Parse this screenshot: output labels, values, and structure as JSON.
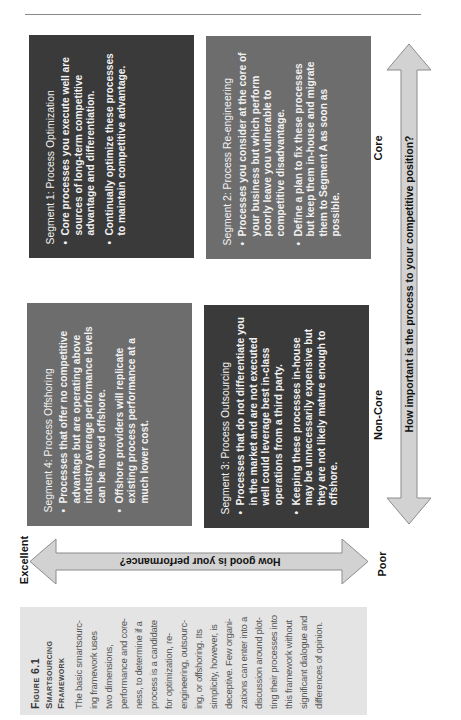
{
  "figure": {
    "number_label": "Figure 6.1",
    "title_lines": [
      "Smartsourcing",
      "Framework"
    ],
    "caption_lines": [
      "The basic smartsourc-",
      "ing framework uses",
      "two dimensions,",
      "performance and core-",
      "ness, to determine if a",
      "process is a candidate",
      "for optimization, re-",
      "engineering, outsourc-",
      "ing, or offshoring. Its",
      "simplicity, however, is",
      "deceptive. Few organi-",
      "zations can enter into a",
      "discussion around plot-",
      "ting their processes into",
      "this framework without",
      "significant dialogue and",
      "differences of opinion."
    ]
  },
  "axes": {
    "importance": {
      "question": "How important is the process to your competitive position?",
      "high_label": "Core",
      "low_label": "Non-Core"
    },
    "performance": {
      "question": "How good is your performance?",
      "high_label": "Excellent",
      "low_label": "Poor"
    }
  },
  "segments": {
    "seg1": {
      "title": "Segment 1: Process Optimization",
      "bullets": [
        "Core processes you execute well are sources of long-term competitive advantage and differentiation.",
        "Continually optimize these processes to maintain competitive advantage."
      ]
    },
    "seg2": {
      "title": "Segment 2: Process Re-engineering",
      "bullets": [
        "Processes you consider at the core of your business but which perform poorly leave you vulnerable to competitive disadvantage.",
        "Define a plan to fix these processes but keep them in-house and migrate them to Segment A as soon as possible."
      ]
    },
    "seg3": {
      "title": "Segment 3: Process Outsourcing",
      "bullets": [
        "Processes that do not differentiate you in the market and are not executed well could leverage best in-class operations from a third party.",
        "Keeping these processes in-house may be unnecessarily expensive but they are not likely mature enough to offshore."
      ]
    },
    "seg4": {
      "title": "Segment 4: Process Offshoring",
      "bullets": [
        "Processes that offer no competitive advantage but are operating above industry average performance levels can be moved offshore.",
        "Offshore providers will replicate existing process performance at a much lower cost."
      ]
    },
    "bullet_glyph": "•"
  },
  "colors": {
    "dark_box": "#3a3a3a",
    "mid_box": "#6d6d6d",
    "arrow_fill": "#d2d2d2",
    "arrow_stroke": "#8c8c8c",
    "caption_bg": "#e4e4e4"
  }
}
